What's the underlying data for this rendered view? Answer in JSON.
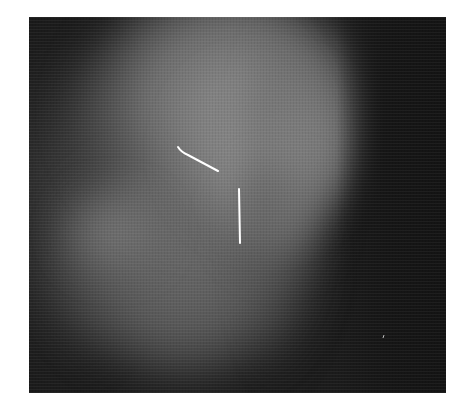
{
  "image": {
    "type": "grayscale radiograph",
    "background_color": "#ffffff",
    "frame": {
      "x": 29,
      "y": 17,
      "width": 417,
      "height": 376
    },
    "markers": [
      {
        "name": "curved-line-marker",
        "color": "#ffffff",
        "points": [
          [
            178,
            147
          ],
          [
            183,
            152
          ],
          [
            200,
            162
          ],
          [
            218,
            171
          ]
        ]
      },
      {
        "name": "vertical-line-marker",
        "color": "#ffffff",
        "points": [
          [
            239,
            189
          ],
          [
            240,
            243
          ]
        ]
      },
      {
        "name": "speck",
        "color": "#bdbdbd",
        "points": [
          [
            383,
            338
          ],
          [
            384,
            335
          ]
        ]
      }
    ]
  }
}
